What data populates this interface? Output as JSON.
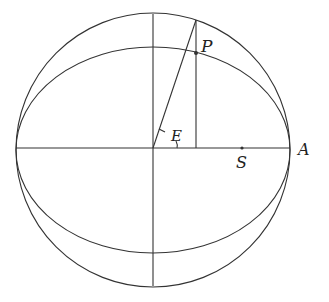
{
  "diagram": {
    "labels": {
      "point_p": "P",
      "angle_e": "E",
      "focus_s": "S",
      "point_a": "A"
    },
    "geometry": {
      "center": [
        153,
        150
      ],
      "circle_radius": 137,
      "ellipse_rx": 137,
      "ellipse_ry": 103,
      "p_x": 196
    },
    "colors": {
      "stroke": "#333333",
      "background": "#ffffff"
    }
  }
}
